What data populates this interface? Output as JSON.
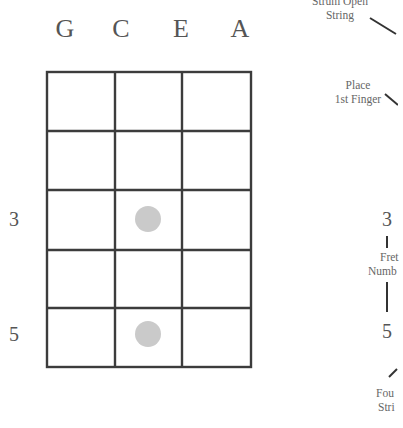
{
  "diagram": {
    "type": "ukulele-chord-chart",
    "strings": [
      "G",
      "C",
      "E",
      "A"
    ],
    "fret_rows": 5,
    "fret_labels": [
      {
        "row": 3,
        "label": "3"
      },
      {
        "row": 5,
        "label": "5"
      }
    ],
    "finger_positions": [
      {
        "string": "C",
        "fret": 3
      },
      {
        "string": "C",
        "fret": 5
      }
    ],
    "dot_color": "#c8c8c8",
    "line_color": "#3c3c3c"
  },
  "legend": {
    "strum_open_string": [
      "Strum Open",
      "String"
    ],
    "place_first_finger": [
      "Place",
      "1st Finger"
    ],
    "fret_number_top": "3",
    "fret_number_label": [
      "Fret",
      "Numb"
    ],
    "fret_number_bottom": "5",
    "fourth_string": [
      "Fou",
      "Stri"
    ]
  }
}
